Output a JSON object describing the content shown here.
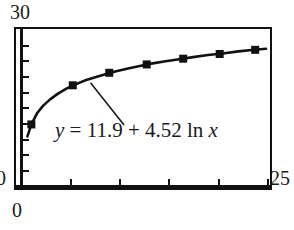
{
  "chart_data": {
    "type": "line",
    "title": "",
    "subtitle": "",
    "xlabel": "",
    "ylabel": "",
    "xlim": [
      0,
      25
    ],
    "ylim": [
      0,
      30
    ],
    "grid": false,
    "legend": "none",
    "annotations": [
      {
        "name": "regression-equation",
        "text": "y = 11.9 + 4.52 ln x",
        "parts": {
          "y": "y",
          "equals": "=",
          "intercept": "11.9",
          "plus": "+",
          "coefficient": "4.52",
          "ln": "ln",
          "x": "x"
        },
        "leader_line": {
          "from_x": 10.4,
          "from_y": 11.8,
          "to_x": 7.0,
          "to_y": 19.9
        }
      }
    ],
    "model": {
      "form": "y = a + b ln x",
      "a": 11.9,
      "b": 4.52
    },
    "series": [
      {
        "name": "logarithmic-fit-curve",
        "style": "solid-line-with-square-markers",
        "color": "#111111",
        "x": [
          0.6,
          1.0,
          1.6,
          2.2,
          2.9,
          3.7,
          4.6,
          5.5,
          6.4,
          7.4,
          8.5,
          9.6,
          10.8,
          12.0,
          13.3,
          14.6,
          16.0,
          17.4,
          18.9,
          20.4,
          22.0,
          23.6,
          24.8
        ],
        "y": [
          9.6,
          11.9,
          14.1,
          15.5,
          16.7,
          17.8,
          18.8,
          19.6,
          20.3,
          20.9,
          21.5,
          22.1,
          22.6,
          23.1,
          23.6,
          24.0,
          24.4,
          24.8,
          25.2,
          25.5,
          25.9,
          26.2,
          26.4
        ]
      },
      {
        "name": "data-points",
        "style": "square-markers",
        "color": "#111111",
        "x": [
          1.0,
          5.2,
          8.9,
          12.7,
          16.4,
          20.1,
          23.7
        ],
        "y": [
          11.9,
          19.4,
          21.8,
          23.4,
          24.5,
          25.4,
          26.2
        ]
      }
    ],
    "axis_labels": {
      "y_max": "30",
      "y_min": "0",
      "x_min": "0",
      "x_max": "25"
    },
    "y_ticks": [
      3,
      6,
      9,
      12,
      15,
      18,
      21,
      24,
      27
    ],
    "x_ticks": [
      5,
      10,
      15,
      20,
      25
    ]
  }
}
